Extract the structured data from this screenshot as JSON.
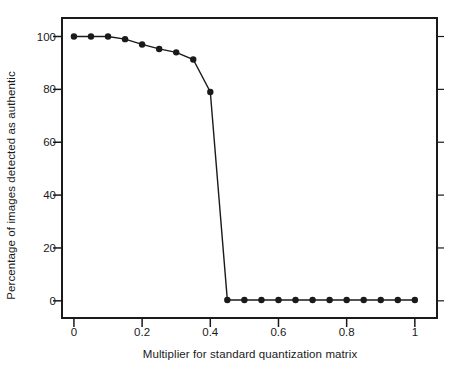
{
  "chart_data": {
    "type": "line",
    "title": "",
    "subtitle": "",
    "xlabel": "Multiplier for standard quantization matrix",
    "ylabel": "Percentage of images detected as authentic",
    "xlim": [
      -0.035,
      1.065
    ],
    "ylim": [
      -6.5,
      107
    ],
    "xticks": [
      0,
      0.2,
      0.4,
      0.6,
      0.8,
      1
    ],
    "xtick_labels": [
      "0",
      "0.2",
      "0.4",
      "0.6",
      "0.8",
      "1"
    ],
    "yticks": [
      0,
      20,
      40,
      60,
      80,
      100
    ],
    "ytick_labels": [
      "0",
      "20",
      "40",
      "60",
      "80",
      "100"
    ],
    "grid": false,
    "legend": null,
    "marker": "filled-circle",
    "line_color": "#1a1a1a",
    "marker_color": "#1a1a1a",
    "background_color": "#ffffff",
    "frame_color": "#1a1a1a",
    "x": [
      0,
      0.05,
      0.1,
      0.15,
      0.2,
      0.25,
      0.3,
      0.35,
      0.4,
      0.45,
      0.5,
      0.55,
      0.6,
      0.65,
      0.7,
      0.75,
      0.8,
      0.85,
      0.9,
      0.95,
      1
    ],
    "values": [
      100,
      100,
      100,
      99,
      97,
      95.3,
      94,
      91.3,
      79,
      0.3,
      0.3,
      0.3,
      0.3,
      0.3,
      0.3,
      0.3,
      0.3,
      0.3,
      0.3,
      0.3,
      0.3
    ],
    "series": [
      {
        "name": "Percentage of images detected as authentic",
        "values": [
          100,
          100,
          100,
          99,
          97,
          95.3,
          94,
          91.3,
          79,
          0.3,
          0.3,
          0.3,
          0.3,
          0.3,
          0.3,
          0.3,
          0.3,
          0.3,
          0.3,
          0.3,
          0.3
        ]
      }
    ]
  }
}
